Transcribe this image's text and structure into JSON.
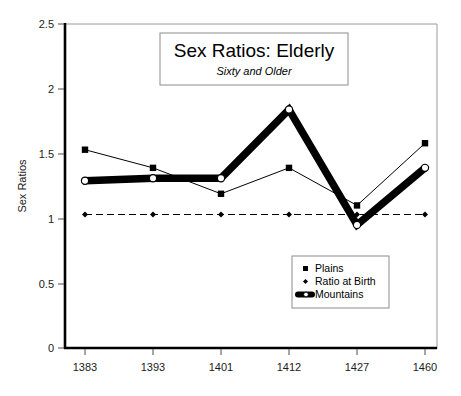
{
  "chart_data": {
    "type": "line",
    "title": "Sex Ratios: Elderly",
    "subtitle": "Sixty and Older",
    "xlabel": "",
    "ylabel": "Sex Ratios",
    "categories": [
      "1383",
      "1393",
      "1401",
      "1412",
      "1427",
      "1460"
    ],
    "ylim": [
      0,
      2.5
    ],
    "yticks": [
      "0",
      "0.5",
      "1",
      "1.5",
      "2",
      "2.5"
    ],
    "ytick_values": [
      0,
      0.5,
      1,
      1.5,
      2,
      2.5
    ],
    "grid": false,
    "legend_position": "inside-lower-right",
    "series": [
      {
        "name": "Plains",
        "marker": "square",
        "line_style": "thin-solid",
        "values": [
          1.53,
          1.39,
          1.19,
          1.39,
          1.1,
          1.58
        ]
      },
      {
        "name": "Ratio at Birth",
        "marker": "diamond",
        "line_style": "dashed",
        "values": [
          1.03,
          1.03,
          1.03,
          1.03,
          1.03,
          1.03
        ]
      },
      {
        "name": "Mountains",
        "marker": "open-circle",
        "line_style": "thick-solid",
        "values": [
          1.29,
          1.31,
          1.31,
          1.84,
          0.95,
          1.39
        ]
      }
    ]
  },
  "legend": {
    "items": [
      {
        "label": "Plains",
        "marker": "square"
      },
      {
        "label": "Ratio at Birth",
        "marker": "diamond"
      },
      {
        "label": "Mountains",
        "marker": "open-circle"
      }
    ]
  },
  "colors": {
    "series_plains": "#000000",
    "series_ratio_at_birth": "#000000",
    "series_mountains": "#000000",
    "axis": "#000000",
    "frame": "#9a9a9a",
    "background": "#ffffff"
  }
}
